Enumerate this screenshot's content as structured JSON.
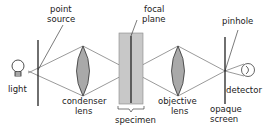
{
  "diagram": {
    "type": "confocal-microscope-schematic",
    "labels": {
      "point_source_1": "point",
      "point_source_2": "source",
      "light": "light",
      "condenser_1": "condenser",
      "condenser_2": "lens",
      "focal_1": "focal",
      "focal_2": "plane",
      "specimen": "specimen",
      "objective_1": "objective",
      "objective_2": "lens",
      "pinhole": "pinhole",
      "detector": "detector",
      "opaque_1": "opaque",
      "opaque_2": "screen"
    },
    "colors": {
      "line": "#222222",
      "lens_fill": "#a9a9a9",
      "specimen_fill": "#c8c8c8",
      "ray": "#555555"
    }
  }
}
